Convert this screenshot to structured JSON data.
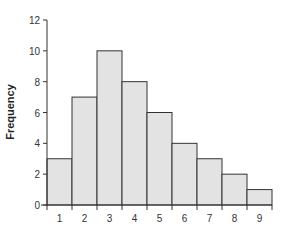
{
  "chart_data": {
    "type": "bar",
    "title": "",
    "xlabel": "",
    "ylabel": "Frequency",
    "categories": [
      "1",
      "2",
      "3",
      "4",
      "5",
      "6",
      "7",
      "8",
      "9"
    ],
    "values": [
      3,
      7,
      10,
      8,
      6,
      4,
      3,
      2,
      1
    ],
    "ylim": [
      0,
      12
    ],
    "yticks": [
      0,
      2,
      4,
      6,
      8,
      10,
      12
    ],
    "grid": false,
    "legend": null,
    "histogram": true,
    "bar_fill": "#e3e3e3",
    "bar_edge": "#333333"
  }
}
